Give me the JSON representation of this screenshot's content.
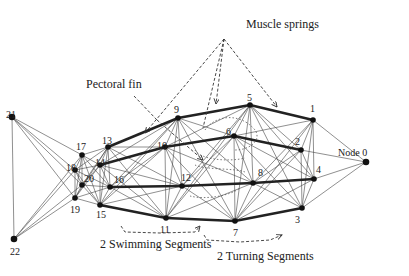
{
  "diagram": {
    "annotations": {
      "muscle_springs": "Muscle springs",
      "pectoral_fin": "Pectoral fin",
      "swimming_segments": "2 Swimming Segments",
      "turning_segments": "2 Turning Segments"
    },
    "nodes": [
      {
        "id": "0",
        "label": "Node 0",
        "x": 366,
        "y": 162,
        "lx": 338,
        "ly": 156
      },
      {
        "id": "1",
        "label": "1",
        "x": 313,
        "y": 120,
        "lx": 310,
        "ly": 112
      },
      {
        "id": "2",
        "label": "2",
        "x": 301,
        "y": 150,
        "lx": 295,
        "ly": 145
      },
      {
        "id": "3",
        "label": "3",
        "x": 302,
        "y": 208,
        "lx": 295,
        "ly": 223
      },
      {
        "id": "4",
        "label": "4",
        "x": 314,
        "y": 179,
        "lx": 316,
        "ly": 173
      },
      {
        "id": "5",
        "label": "5",
        "x": 250,
        "y": 105,
        "lx": 247,
        "ly": 101
      },
      {
        "id": "6",
        "label": "6",
        "x": 234,
        "y": 136,
        "lx": 226,
        "ly": 135
      },
      {
        "id": "7",
        "label": "7",
        "x": 235,
        "y": 221,
        "lx": 233,
        "ly": 236
      },
      {
        "id": "8",
        "label": "8",
        "x": 253,
        "y": 183,
        "lx": 258,
        "ly": 176
      },
      {
        "id": "9",
        "label": "9",
        "x": 178,
        "y": 118,
        "lx": 174,
        "ly": 113
      },
      {
        "id": "10",
        "label": "10",
        "x": 165,
        "y": 147,
        "lx": 157,
        "ly": 149
      },
      {
        "id": "11",
        "label": "11",
        "x": 166,
        "y": 218,
        "lx": 160,
        "ly": 233
      },
      {
        "id": "12",
        "label": "12",
        "x": 182,
        "y": 186,
        "lx": 181,
        "ly": 181
      },
      {
        "id": "13",
        "label": "13",
        "x": 108,
        "y": 147,
        "lx": 102,
        "ly": 144
      },
      {
        "id": "14",
        "label": "14",
        "x": 100,
        "y": 165,
        "lx": 95,
        "ly": 166
      },
      {
        "id": "15",
        "label": "15",
        "x": 100,
        "y": 205,
        "lx": 96,
        "ly": 218
      },
      {
        "id": "16",
        "label": "16",
        "x": 110,
        "y": 187,
        "lx": 114,
        "ly": 183
      },
      {
        "id": "17",
        "label": "17",
        "x": 82,
        "y": 155,
        "lx": 76,
        "ly": 150
      },
      {
        "id": "18",
        "label": "18",
        "x": 75,
        "y": 170,
        "lx": 66,
        "ly": 171
      },
      {
        "id": "19",
        "label": "19",
        "x": 75,
        "y": 198,
        "lx": 70,
        "ly": 213
      },
      {
        "id": "20",
        "label": "20",
        "x": 82,
        "y": 185,
        "lx": 84,
        "ly": 182
      },
      {
        "id": "21",
        "label": "21",
        "x": 12,
        "y": 117,
        "lx": 6,
        "ly": 118
      },
      {
        "id": "22",
        "label": "22",
        "x": 14,
        "y": 239,
        "lx": 10,
        "ly": 255
      }
    ],
    "thick_edges": [
      [
        "13",
        "9"
      ],
      [
        "9",
        "5"
      ],
      [
        "5",
        "1"
      ],
      [
        "14",
        "10"
      ],
      [
        "10",
        "6"
      ],
      [
        "6",
        "2"
      ],
      [
        "16",
        "12"
      ],
      [
        "12",
        "8"
      ],
      [
        "8",
        "4"
      ],
      [
        "15",
        "11"
      ],
      [
        "11",
        "7"
      ],
      [
        "7",
        "3"
      ]
    ],
    "thin_edges": [
      [
        "1",
        "0"
      ],
      [
        "2",
        "0"
      ],
      [
        "3",
        "0"
      ],
      [
        "4",
        "0"
      ],
      [
        "1",
        "2"
      ],
      [
        "1",
        "4"
      ],
      [
        "1",
        "3"
      ],
      [
        "2",
        "4"
      ],
      [
        "2",
        "3"
      ],
      [
        "3",
        "4"
      ],
      [
        "5",
        "6"
      ],
      [
        "5",
        "8"
      ],
      [
        "5",
        "7"
      ],
      [
        "6",
        "8"
      ],
      [
        "6",
        "7"
      ],
      [
        "8",
        "7"
      ],
      [
        "5",
        "2"
      ],
      [
        "5",
        "4"
      ],
      [
        "5",
        "3"
      ],
      [
        "6",
        "1"
      ],
      [
        "6",
        "4"
      ],
      [
        "6",
        "3"
      ],
      [
        "8",
        "1"
      ],
      [
        "8",
        "2"
      ],
      [
        "8",
        "3"
      ],
      [
        "7",
        "1"
      ],
      [
        "7",
        "2"
      ],
      [
        "7",
        "4"
      ],
      [
        "9",
        "10"
      ],
      [
        "9",
        "12"
      ],
      [
        "9",
        "11"
      ],
      [
        "10",
        "12"
      ],
      [
        "10",
        "11"
      ],
      [
        "12",
        "11"
      ],
      [
        "9",
        "6"
      ],
      [
        "9",
        "8"
      ],
      [
        "9",
        "7"
      ],
      [
        "10",
        "5"
      ],
      [
        "10",
        "8"
      ],
      [
        "10",
        "7"
      ],
      [
        "12",
        "5"
      ],
      [
        "12",
        "6"
      ],
      [
        "12",
        "7"
      ],
      [
        "11",
        "5"
      ],
      [
        "11",
        "6"
      ],
      [
        "11",
        "8"
      ],
      [
        "13",
        "14"
      ],
      [
        "13",
        "16"
      ],
      [
        "13",
        "15"
      ],
      [
        "14",
        "16"
      ],
      [
        "14",
        "15"
      ],
      [
        "16",
        "15"
      ],
      [
        "13",
        "10"
      ],
      [
        "13",
        "12"
      ],
      [
        "13",
        "11"
      ],
      [
        "14",
        "9"
      ],
      [
        "14",
        "12"
      ],
      [
        "14",
        "11"
      ],
      [
        "16",
        "9"
      ],
      [
        "16",
        "10"
      ],
      [
        "16",
        "11"
      ],
      [
        "15",
        "9"
      ],
      [
        "15",
        "10"
      ],
      [
        "15",
        "12"
      ],
      [
        "17",
        "18"
      ],
      [
        "17",
        "20"
      ],
      [
        "17",
        "19"
      ],
      [
        "18",
        "20"
      ],
      [
        "18",
        "19"
      ],
      [
        "20",
        "19"
      ],
      [
        "17",
        "13"
      ],
      [
        "17",
        "14"
      ],
      [
        "17",
        "16"
      ],
      [
        "17",
        "15"
      ],
      [
        "18",
        "13"
      ],
      [
        "18",
        "14"
      ],
      [
        "18",
        "16"
      ],
      [
        "18",
        "15"
      ],
      [
        "20",
        "13"
      ],
      [
        "20",
        "14"
      ],
      [
        "20",
        "16"
      ],
      [
        "20",
        "15"
      ],
      [
        "19",
        "13"
      ],
      [
        "19",
        "14"
      ],
      [
        "19",
        "16"
      ],
      [
        "19",
        "15"
      ],
      [
        "21",
        "22"
      ],
      [
        "21",
        "17"
      ],
      [
        "21",
        "18"
      ],
      [
        "21",
        "20"
      ],
      [
        "21",
        "19"
      ],
      [
        "22",
        "17"
      ],
      [
        "22",
        "18"
      ],
      [
        "22",
        "20"
      ],
      [
        "22",
        "19"
      ]
    ]
  }
}
